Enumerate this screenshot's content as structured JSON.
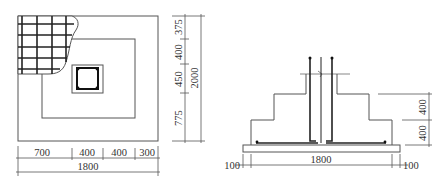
{
  "plan_view": {
    "title": "Foundation plan",
    "dims_right": [
      "375",
      "400",
      "450",
      "775"
    ],
    "dim_right_total": "2000",
    "dims_bottom": [
      "700",
      "400",
      "400",
      "300"
    ],
    "dim_bottom_total": "1800"
  },
  "section_view": {
    "title": "Foundation section",
    "dims_right": [
      "400",
      "400"
    ],
    "dim_bottom_total": "1800",
    "dim_bottom_left": "100",
    "dim_bottom_right": "100"
  },
  "colors": {
    "line": "#555555",
    "rebar": "#222222",
    "background": "#ffffff"
  }
}
